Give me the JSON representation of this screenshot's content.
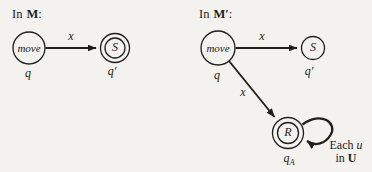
{
  "colors": {
    "background": "#f4f2ee",
    "ink": "#201e1b"
  },
  "machine_m": {
    "title": {
      "word": "In",
      "name": "M",
      "colon": ":"
    },
    "states": {
      "move": {
        "label": "move",
        "state_id": "q"
      },
      "s": {
        "label": "S",
        "state_id": "q′"
      }
    },
    "transition_to_s_label": "x"
  },
  "machine_m_prime": {
    "title": {
      "word": "In",
      "name": "M′",
      "colon": ":"
    },
    "states": {
      "move": {
        "label": "move",
        "state_id": "q"
      },
      "s": {
        "label": "S",
        "state_id": "q′"
      },
      "r": {
        "label": "R",
        "state_id_base": "q",
        "state_id_sub": "A"
      }
    },
    "transition_to_s_label": "x",
    "transition_to_r_label": "x",
    "loop_label": {
      "word1": "Each",
      "var1": "u",
      "word2": "in",
      "set": "U"
    }
  }
}
